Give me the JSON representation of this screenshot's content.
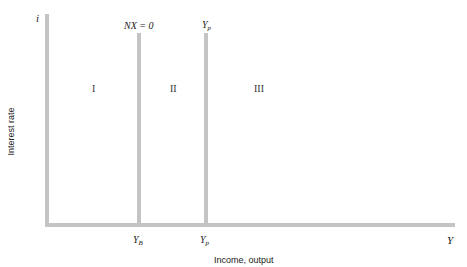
{
  "diagram": {
    "y_axis": {
      "symbol": "i",
      "label": "Interest rate"
    },
    "x_axis": {
      "symbol": "Y",
      "label": "Income, output"
    },
    "vertical_lines": [
      {
        "top_label": "NX = 0",
        "bottom_label_main": "Y",
        "bottom_label_sub": "B"
      },
      {
        "top_label_main": "Y",
        "top_label_sub": "p",
        "bottom_label_main": "Y",
        "bottom_label_sub": "p"
      }
    ],
    "regions": [
      "I",
      "II",
      "III"
    ],
    "colors": {
      "axis": "#c4c4c4",
      "text": "#222222"
    }
  }
}
